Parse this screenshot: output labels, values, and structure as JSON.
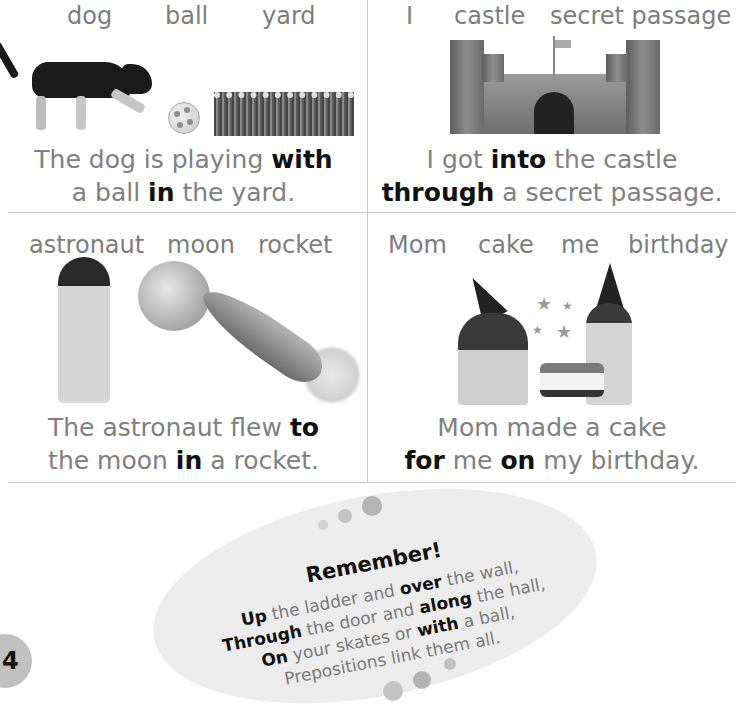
{
  "panels": [
    {
      "words": [
        "dog",
        "ball",
        "yard"
      ],
      "sentence": {
        "line1": [
          {
            "t": "The dog is playing ",
            "b": false
          },
          {
            "t": "with",
            "b": true
          }
        ],
        "line2": [
          {
            "t": "a ball ",
            "b": false
          },
          {
            "t": "in",
            "b": true
          },
          {
            "t": " the yard.",
            "b": false
          }
        ]
      },
      "images": [
        "dog-image",
        "ball-image",
        "grass-image"
      ]
    },
    {
      "words": [
        "I",
        "castle",
        "secret passage"
      ],
      "sentence": {
        "line1": [
          {
            "t": "I got ",
            "b": false
          },
          {
            "t": "into",
            "b": true
          },
          {
            "t": " the castle",
            "b": false
          }
        ],
        "line2": [
          {
            "t": "through",
            "b": true
          },
          {
            "t": " a secret passage.",
            "b": false
          }
        ]
      },
      "images": [
        "castle-image"
      ]
    },
    {
      "words": [
        "astronaut",
        "moon",
        "rocket"
      ],
      "sentence": {
        "line1": [
          {
            "t": "The astronaut flew ",
            "b": false
          },
          {
            "t": "to",
            "b": true
          }
        ],
        "line2": [
          {
            "t": "the moon ",
            "b": false
          },
          {
            "t": "in",
            "b": true
          },
          {
            "t": " a rocket.",
            "b": false
          }
        ]
      },
      "images": [
        "astronaut-image",
        "moon-image",
        "rocket-image"
      ]
    },
    {
      "words": [
        "Mom",
        "cake",
        "me",
        "birthday"
      ],
      "sentence": {
        "line1": [
          {
            "t": "Mom made a cake",
            "b": false
          }
        ],
        "line2": [
          {
            "t": "for",
            "b": true
          },
          {
            "t": " me ",
            "b": false
          },
          {
            "t": "on",
            "b": true
          },
          {
            "t": " my birthday.",
            "b": false
          }
        ]
      },
      "images": [
        "mom-and-girl-cake-image"
      ]
    }
  ],
  "remember": {
    "title": "Remember!",
    "lines": [
      [
        {
          "t": "Up",
          "b": true
        },
        {
          "t": " the ladder and ",
          "b": false
        },
        {
          "t": "over",
          "b": true
        },
        {
          "t": " the wall,",
          "b": false
        }
      ],
      [
        {
          "t": "Through",
          "b": true
        },
        {
          "t": " the door and ",
          "b": false
        },
        {
          "t": "along",
          "b": true
        },
        {
          "t": " the hall,",
          "b": false
        }
      ],
      [
        {
          "t": "On",
          "b": true
        },
        {
          "t": " your skates or ",
          "b": false
        },
        {
          "t": "with",
          "b": true
        },
        {
          "t": " a ball,",
          "b": false
        }
      ],
      [
        {
          "t": "Prepositions link them all.",
          "b": false
        }
      ]
    ]
  },
  "page_number": "4",
  "colors": {
    "text_gray": "#7d7d7d",
    "bold_text": "#111111",
    "oval_bg": "#ececec",
    "divider": "#c8c8c8",
    "page_badge": "#c0c0c0"
  }
}
